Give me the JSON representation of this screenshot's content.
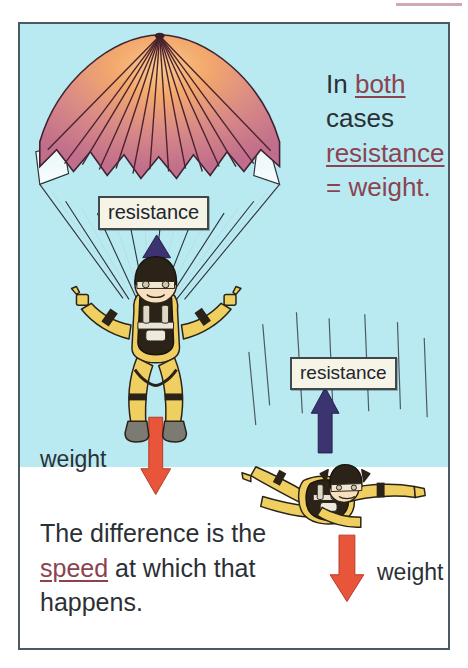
{
  "figure": {
    "title_rule": "decorative-pink-rule",
    "sky_color": "#b9eaf2",
    "ground_color": "#ffffff",
    "frame_color": "#4a5a60"
  },
  "labels": {
    "resistance_parachute": "resistance",
    "resistance_freefall": "resistance",
    "weight_parachute": "weight",
    "weight_freefall": "weight"
  },
  "statement": {
    "word_in": "In ",
    "word_both": "both",
    "word_cases": "cases",
    "word_resistance": "resistance",
    "word_equals_weight": "= weight."
  },
  "bottom_statement": {
    "part1": "The difference is the ",
    "highlight": "speed",
    "part2": " at which that happens."
  },
  "colors": {
    "canopy_center": "#f2a868",
    "canopy_edge": "#c9718a",
    "canopy_line": "#4a2330",
    "suit": "#f0cf61",
    "suit_shadow": "#d8ae3e",
    "harness": "#2b2318",
    "boot": "#7b7b73",
    "skin": "#f6e0c0",
    "arrow_down": "#e8553a",
    "arrow_up": "#3b3470",
    "text_dark": "#2b3035",
    "text_highlight": "#8c4350",
    "label_box_bg": "#f6f3e7",
    "label_box_border": "#41484c",
    "rule_pink": "#c99aa4"
  },
  "arrows": {
    "parachute_weight_direction": "down",
    "parachute_resistance_direction": "up",
    "freefall_weight_direction": "down",
    "freefall_resistance_direction": "up"
  }
}
